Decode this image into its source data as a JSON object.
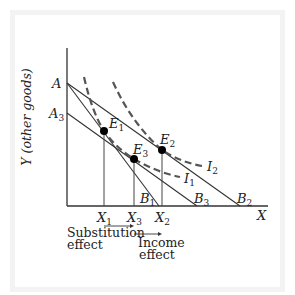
{
  "diagram": {
    "y_axis_label": "Y (other goods)",
    "x_axis_label": "X",
    "intercepts": {
      "A": {
        "base": "A",
        "sub": ""
      },
      "A3": {
        "base": "A",
        "sub": "3"
      },
      "B1": {
        "base": "B",
        "sub": "1"
      },
      "B2": {
        "base": "B",
        "sub": "2"
      },
      "B3": {
        "base": "B",
        "sub": "3"
      }
    },
    "equilibria": {
      "E1": {
        "base": "E",
        "sub": "1"
      },
      "E2": {
        "base": "E",
        "sub": "2"
      },
      "E3": {
        "base": "E",
        "sub": "3"
      }
    },
    "indifference_curves": {
      "I1": {
        "base": "I",
        "sub": "1"
      },
      "I2": {
        "base": "I",
        "sub": "2"
      }
    },
    "quantities": {
      "X1": {
        "base": "X",
        "sub": "1"
      },
      "X2": {
        "base": "X",
        "sub": "2"
      },
      "X3": {
        "base": "X",
        "sub": "3"
      }
    },
    "effects": {
      "substitution_line1": "Substitution",
      "substitution_line2": "effect",
      "income_line1": "Income",
      "income_line2": "effect"
    },
    "budget_lines": [
      {
        "name": "AB1",
        "from": "A",
        "to": "B1"
      },
      {
        "name": "AB2",
        "from": "A",
        "to": "B2"
      },
      {
        "name": "A3B3",
        "from": "A3",
        "to": "B3"
      }
    ],
    "colors": {
      "lines": "#333333",
      "dashed_curves": "#555555",
      "points": "#000000",
      "frame": "#f3f3f3"
    }
  }
}
